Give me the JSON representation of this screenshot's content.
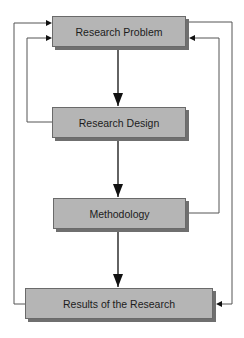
{
  "diagram": {
    "nodes": [
      {
        "id": "problem",
        "label": "Research Problem"
      },
      {
        "id": "design",
        "label": "Research Design"
      },
      {
        "id": "methodology",
        "label": "Methodology"
      },
      {
        "id": "results",
        "label": "Results of the Research"
      }
    ],
    "edges": [
      {
        "from": "problem",
        "to": "design",
        "style": "main-arrow"
      },
      {
        "from": "design",
        "to": "methodology",
        "style": "main-arrow"
      },
      {
        "from": "methodology",
        "to": "results",
        "style": "main-arrow"
      },
      {
        "from": "results",
        "to": "problem",
        "style": "feedback-left-outer"
      },
      {
        "from": "design",
        "to": "problem",
        "style": "feedback-left-inner"
      },
      {
        "from": "problem",
        "to": "results",
        "style": "feedback-right-outer"
      },
      {
        "from": "methodology",
        "to": "problem",
        "style": "feedback-right-inner"
      }
    ],
    "colors": {
      "box_fill": "#b5b5b5",
      "box_border": "#6a6a6a",
      "box_shadow": "#6f6f6f",
      "line": "#4a4a4a",
      "background": "#ffffff"
    }
  }
}
